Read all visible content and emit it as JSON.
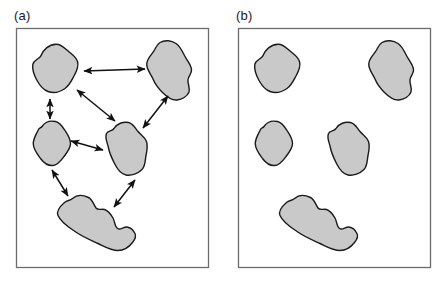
{
  "figure": {
    "width": 439,
    "height": 281,
    "background_color": "#ffffff"
  },
  "style": {
    "patch_fill": "#c9c9c9",
    "patch_stroke": "#1a1a1a",
    "patch_stroke_width": 1.4,
    "frame_stroke": "#6b6b70",
    "frame_stroke_width": 1.3,
    "frame_fill": "#ffffff",
    "arrow_color": "#111111",
    "arrow_stroke_width": 1.5,
    "label_color": "#1a1a1a",
    "label_font_size": 13
  },
  "panels": [
    {
      "id": "a",
      "label": "(a)",
      "frame": {
        "x": 16,
        "y": 28,
        "width": 193,
        "height": 240
      },
      "has_arrows": true,
      "patch_count": 5,
      "arrow_count": 8
    },
    {
      "id": "b",
      "label": "(b)",
      "frame": {
        "x": 19,
        "y": 28,
        "width": 193,
        "height": 240
      },
      "has_arrows": false,
      "patch_count": 5,
      "arrow_count": 0
    }
  ],
  "patches": [
    {
      "name": "patch-top-left",
      "bbox": [
        32,
        44,
        46,
        49
      ],
      "path": "M 40.5 56.5 C 43 49.5 49 44.5 56 44.2 C 61 44.0 64 47.5 67.5 50.5 C 71.5 54 76 56.5 77.5 61.5 C 79 66.5 76.5 71.5 74 76 C 71.5 80.5 69.5 85.5 65 88.5 C 60 92 53.5 93.5 48 91.5 C 43 89.7 39.5 85 37 80.5 C 34.3 75.5 32 70 32.8 64.5 C 33.4 60.5 38 59.5 40.5 56.5 Z"
    },
    {
      "name": "patch-top-right",
      "bbox": [
        146,
        40,
        52,
        61
      ],
      "path": "M 160 42.5 C 165 39.5 171.5 40.5 176 43.5 C 180.5 46.5 182.5 52 185 56.5 C 187.5 61 191 64.5 191.5 69.5 C 192 73.5 188.5 76 188 79.5 C 187.3 84 190.5 88 189 92 C 187.3 96.5 182 99.5 177 100 C 171.5 100.5 166.5 96.5 162.5 92.5 C 158.5 88.5 155 84 153 79 C 150.8 73.5 146.2 69.5 146.8 63.5 C 147.3 58 152 54.5 154.5 50 C 156.3 46.8 157 44.3 160 42.5 Z"
    },
    {
      "name": "patch-middle-left",
      "bbox": [
        33,
        121,
        38,
        45
      ],
      "path": "M 42 126.5 C 45 122 50.5 120.5 55.5 121.5 C 60 122.4 62.5 126.5 65 130.5 C 67.5 134.5 70.5 138.5 70.5 143.5 C 70.5 148.5 67 152.5 64 156.5 C 61 160.5 58 165 53 165.5 C 48 166 43.5 162.5 40.5 158.5 C 37.3 154.2 33.5 149.5 33.3 144 C 33.1 138.5 36.5 134 38.5 129.5 C 39.4 127.5 40.8 128.3 42 126.5 Z"
    },
    {
      "name": "patch-center",
      "bbox": [
        105,
        122,
        44,
        54
      ],
      "path": "M 114 128.5 C 117 123.5 123 121.5 128.5 122.5 C 133 123.3 135 128 138 131.5 C 141 135 145 137 146.5 141.5 C 148 146 147 151 146 155.5 C 145 160.5 145.5 166 142 169.5 C 138 173.5 131.5 176 126 175 C 120.5 174 117 168.5 114.5 163.5 C 112 158.5 109.5 153.5 108.5 148 C 107.6 143 104.5 138 106.5 133.5 C 108 130.2 112 131.5 114 128.5 Z"
    },
    {
      "name": "patch-bottom",
      "bbox": [
        57,
        195,
        79,
        56
      ],
      "path": "M 72.5 198.5 C 77 194.5 83.5 195 88.5 197.5 C 92.5 199.5 93.5 204.5 96 208 C 98 210.8 101.5 208.5 104.5 209.5 C 108.5 210.8 111 214.5 113 218 C 115 221.5 114.5 226.5 117.5 228.5 C 120.5 230.5 123.5 226.5 127 227 C 130.5 227.5 133.5 230.5 135 233.5 C 136.5 236.5 134.5 240 132.5 242.5 C 129 247 124 250.5 118 250.5 C 111 250.5 104.5 246.5 98 243.5 C 90 239.8 82 236.5 75 231.5 C 68.5 227 61 222.5 58 215.5 C 55.8 210.5 60.5 206 64.5 202.5 C 67.3 200.1 69.8 200.9 72.5 198.5 Z"
    }
  ],
  "arrows": [
    {
      "name": "arrow-top-left-to-top-right",
      "x1": 84,
      "y1": 71,
      "x2": 145,
      "y2": 69,
      "double_headed": true
    },
    {
      "name": "arrow-top-left-to-middle-left",
      "x1": 50,
      "y1": 99,
      "x2": 50,
      "y2": 119,
      "double_headed": true
    },
    {
      "name": "arrow-top-left-to-center",
      "x1": 77,
      "y1": 90,
      "x2": 115,
      "y2": 121,
      "double_headed": true
    },
    {
      "name": "arrow-top-right-to-center",
      "x1": 168,
      "y1": 96,
      "x2": 143,
      "y2": 128,
      "double_headed": true
    },
    {
      "name": "arrow-middle-left-to-center",
      "x1": 71,
      "y1": 141,
      "x2": 103,
      "y2": 150,
      "double_headed": true
    },
    {
      "name": "arrow-middle-left-to-bottom",
      "x1": 52,
      "y1": 170,
      "x2": 68,
      "y2": 196,
      "double_headed": true
    },
    {
      "name": "arrow-center-to-bottom",
      "x1": 135,
      "y1": 180,
      "x2": 114,
      "y2": 207,
      "double_headed": true
    }
  ]
}
